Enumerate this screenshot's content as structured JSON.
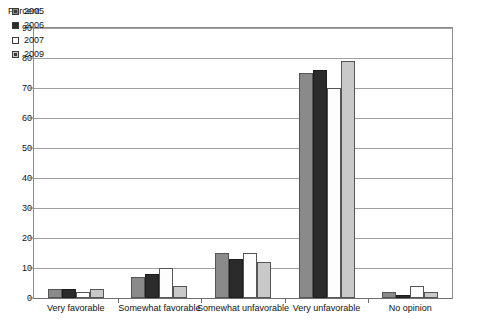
{
  "chart_data": {
    "type": "bar",
    "title": "",
    "subtitle": "",
    "xlabel": "",
    "ylabel": "Percent",
    "ylim": [
      0,
      90
    ],
    "ytick_step": 10,
    "yticks": [
      0,
      10,
      20,
      30,
      40,
      50,
      60,
      70,
      80,
      90
    ],
    "grid": true,
    "legend_position": "top-left",
    "categories": [
      "Very favorable",
      "Somewhat favorable",
      "Somewhat unfavorable",
      "Very unfavorable",
      "No opinion"
    ],
    "series": [
      {
        "name": "2005",
        "color": "#8a8a8a",
        "values": [
          3,
          7,
          15,
          75,
          2
        ]
      },
      {
        "name": "2006",
        "color": "#2b2b2b",
        "values": [
          3,
          8,
          13,
          76,
          1
        ]
      },
      {
        "name": "2007",
        "color": "#fdfdfd",
        "values": [
          2,
          10,
          15,
          70,
          4
        ]
      },
      {
        "name": "2009",
        "color": "#c9c9c9",
        "values": [
          3,
          4,
          12,
          79,
          2
        ]
      }
    ]
  },
  "axis": {
    "y_unit_label": "Percent"
  },
  "legend": {
    "entries": [
      {
        "label": "2005",
        "swatch": "gray-inner-square-swatch"
      },
      {
        "label": "2006",
        "swatch": "solid-black-swatch"
      },
      {
        "label": "2007",
        "swatch": "white-empty-swatch"
      },
      {
        "label": "2009",
        "swatch": "light-gray-swatch"
      }
    ]
  }
}
